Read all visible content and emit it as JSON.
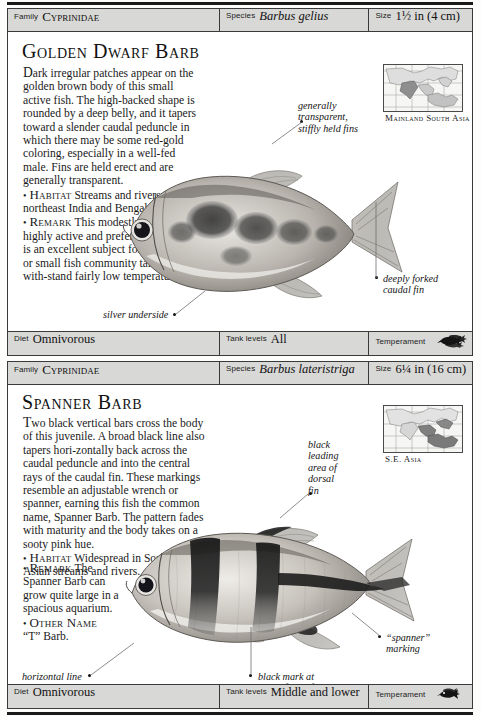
{
  "page": {
    "background_color": "#fdfdfb",
    "rule_color": "#1a1a1a"
  },
  "entries": [
    {
      "id": "golden-dwarf-barb",
      "header": {
        "family_label": "Family",
        "family_value": "Cyprinidae",
        "species_label": "Species",
        "species_value": "Barbus gelius",
        "size_label": "Size",
        "size_value": "1½ in (4 cm)"
      },
      "title": "Golden Dwarf Barb",
      "description_paragraph": "ark irregular patches appear on the golden brown body of this small active fish. The high-backed shape is rounded by a deep belly, and it tapers toward a slender caudal peduncle in which there may be some red-gold coloring, especially in a well-fed male. Fins are held erect and are generally transparent.",
      "description_dropcap": "D",
      "habitat_label": "Habitat",
      "habitat_text": "Streams and rivers in northeast India and Bengal.",
      "remark_label": "Remark",
      "remark_text": "This modestly sized fish is highly active and prefers to shoal. It is an excellent subject for the species or small fish community tank and can with-stand fairly low temperatures.",
      "map_caption": "Mainland\nSouth Asia",
      "callouts": [
        {
          "name": "generally-transparent-fins",
          "text": "generally\ntransparent,\nstiffly held fins"
        },
        {
          "name": "deeply-forked-caudal-fin",
          "text": "deeply forked\ncaudal fin"
        },
        {
          "name": "silver-underside",
          "text": "silver underside"
        }
      ],
      "footer": {
        "diet_label": "Diet",
        "diet_value": "Omnivorous",
        "tank_levels_label": "Tank levels",
        "tank_levels_value": "All",
        "temperament_label": "Temperament",
        "temperament_icon": "fish-shoal-icon"
      }
    },
    {
      "id": "spanner-barb",
      "header": {
        "family_label": "Family",
        "family_value": "Cyprinidae",
        "species_label": "Species",
        "species_value": "Barbus lateristriga",
        "size_label": "Size",
        "size_value": "6¼ in (16 cm)"
      },
      "title": "Spanner Barb",
      "description_paragraph": "wo black vertical bars cross the body of this juvenile. A broad black line also tapers hori-zontally back across the caudal peduncle and into the central rays of the caudal fin. These markings resemble an adjustable wrench or spanner, earning this fish the common name, Spanner Barb. The pattern fades with maturity and the body takes on a sooty pink hue.",
      "description_dropcap": "T",
      "habitat_label": "Habitat",
      "habitat_text": "Widespread in South-east Asian streams and rivers.",
      "remark_label": "Remark",
      "remark_text": "The Spanner Barb can grow quite large in a spacious aquarium.",
      "other_name_label": "Other Name",
      "other_name_text": "“T” Barb.",
      "map_caption": "S.E. Asia",
      "callouts": [
        {
          "name": "black-leading-area-of-dorsal-fin",
          "text": "black\nleading\narea of\ndorsal\nfin"
        },
        {
          "name": "spanner-marking",
          "text": "“spanner”\nmarking"
        },
        {
          "name": "black-mark-at-base-of-anal-fin",
          "text": "black mark at\nbase of anal fin"
        },
        {
          "name": "horizontal-line-continues-into-caudal-fin",
          "text": "horizontal line\ncontinues into\ncaudal fin"
        }
      ],
      "footer": {
        "diet_label": "Diet",
        "diet_value": "Omnivorous",
        "tank_levels_label": "Tank levels",
        "tank_levels_value": "Middle and lower",
        "temperament_label": "Temperament",
        "temperament_icon": "fish-pair-icon"
      }
    }
  ]
}
